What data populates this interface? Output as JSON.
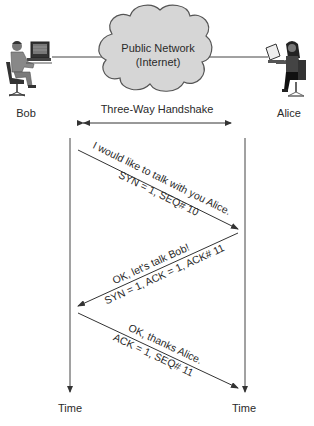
{
  "diagram": {
    "title": "Three-Way Handshake",
    "network": {
      "line1": "Public Network",
      "line2": "(Internet)"
    },
    "participants": {
      "left": {
        "name": "Bob",
        "device": "desktop-computer"
      },
      "right": {
        "name": "Alice",
        "device": "laptop"
      }
    },
    "timelines": {
      "left_label": "Time",
      "right_label": "Time"
    },
    "messages": [
      {
        "direction": "Bob -> Alice",
        "text": "I would like to talk with you Alice.",
        "flags": "SYN = 1, SEQ# 10"
      },
      {
        "direction": "Alice -> Bob",
        "text": "OK, let's talk Bob!",
        "flags": "SYN = 1, ACK = 1, ACK# 11"
      },
      {
        "direction": "Bob -> Alice",
        "text": "OK, thanks Alice.",
        "flags": "ACK = 1, SEQ# 11"
      }
    ],
    "colors": {
      "line": "#333333",
      "cloud_fill": "#d4d4d4",
      "cloud_stroke": "#555555",
      "text": "#2a2a2a"
    }
  }
}
